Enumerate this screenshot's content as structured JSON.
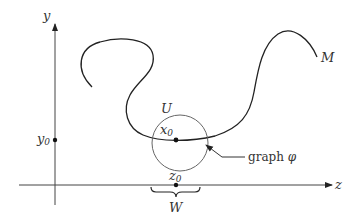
{
  "diagram": {
    "axes": {
      "y_label": "y",
      "z_label": "z",
      "y0_label": "y",
      "y0_sub": "0"
    },
    "manifold": {
      "label": "M"
    },
    "neighborhood": {
      "label": "U"
    },
    "point_x0": {
      "label": "x",
      "sub": "0"
    },
    "point_z0": {
      "label": "z",
      "sub": "0"
    },
    "interval": {
      "label": "W"
    },
    "graph": {
      "label_text": "graph ",
      "label_symbol": "φ"
    },
    "colors": {
      "curve": "#222222",
      "axes": "#333333",
      "circle": "#555555",
      "background": "#ffffff"
    }
  }
}
